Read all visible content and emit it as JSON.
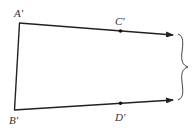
{
  "diagram": {
    "title": "",
    "points": {
      "A": {
        "label": "A′"
      },
      "B": {
        "label": "B′"
      },
      "C": {
        "label": "C′"
      },
      "D": {
        "label": "D′"
      }
    },
    "elements": [
      {
        "type": "segment",
        "from": "A",
        "to": "B"
      },
      {
        "type": "ray",
        "from": "A",
        "through": "C",
        "arrow": true
      },
      {
        "type": "ray",
        "from": "B",
        "through": "D",
        "arrow": true
      },
      {
        "type": "brace",
        "side": "right",
        "spans": [
          "ray-A",
          "ray-B"
        ]
      }
    ],
    "colors": {
      "stroke": "#222222",
      "label": "#333333"
    }
  }
}
